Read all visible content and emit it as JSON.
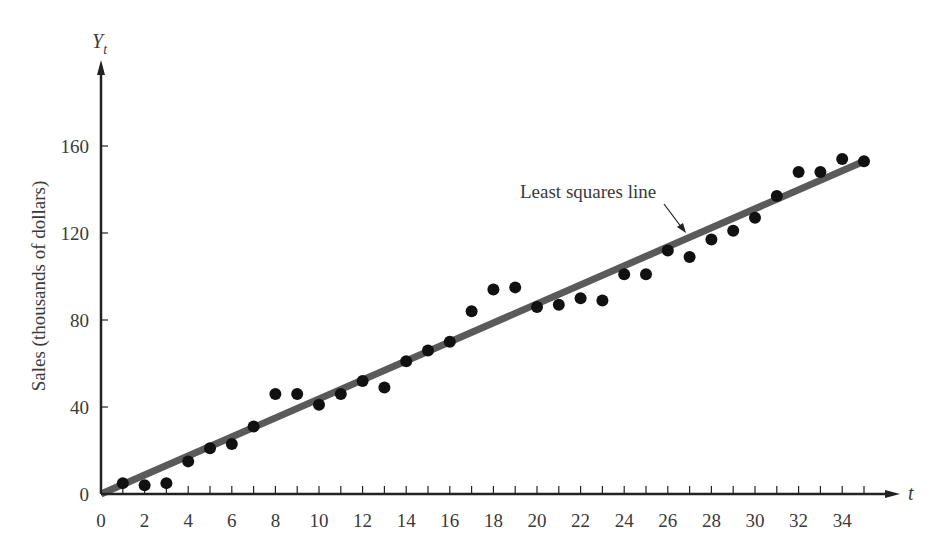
{
  "chart_data": {
    "type": "scatter",
    "title": "",
    "xlabel": "t",
    "ylabel": "Sales (thousands of dollars)",
    "y_axis_symbol": "Y",
    "y_axis_symbol_sub": "t",
    "xlim": [
      0,
      36
    ],
    "ylim": [
      0,
      190
    ],
    "x_ticks": [
      0,
      2,
      4,
      6,
      8,
      10,
      12,
      14,
      16,
      18,
      20,
      22,
      24,
      26,
      28,
      30,
      32,
      34
    ],
    "x_minor_ticks": [
      1,
      3,
      5,
      7,
      9,
      11,
      13,
      15,
      17,
      19,
      21,
      23,
      25,
      27,
      29,
      31,
      33,
      35
    ],
    "y_ticks": [
      0,
      40,
      80,
      120,
      160
    ],
    "grid": false,
    "legend": null,
    "series": [
      {
        "name": "Sales",
        "marker": "filled-circle",
        "color": "#111111",
        "x": [
          1,
          2,
          3,
          4,
          5,
          6,
          7,
          8,
          9,
          10,
          11,
          12,
          13,
          14,
          15,
          16,
          17,
          18,
          19,
          20,
          21,
          22,
          23,
          24,
          25,
          26,
          27,
          28,
          29,
          30,
          31,
          32,
          33,
          34,
          35
        ],
        "y": [
          5,
          4,
          5,
          15,
          21,
          23,
          31,
          46,
          46,
          41,
          46,
          52,
          49,
          61,
          66,
          70,
          84,
          94,
          95,
          86,
          87,
          90,
          89,
          101,
          101,
          112,
          109,
          117,
          121,
          127,
          137,
          148,
          148,
          154,
          153
        ]
      },
      {
        "name": "Least squares line",
        "type": "line",
        "color": "#5a5a5a",
        "x": [
          0,
          35
        ],
        "y": [
          0,
          153
        ]
      }
    ],
    "annotations": [
      {
        "text": "Least squares line",
        "x": 21.5,
        "y": 136,
        "arrow_to": [
          26.5,
          118
        ]
      }
    ]
  }
}
